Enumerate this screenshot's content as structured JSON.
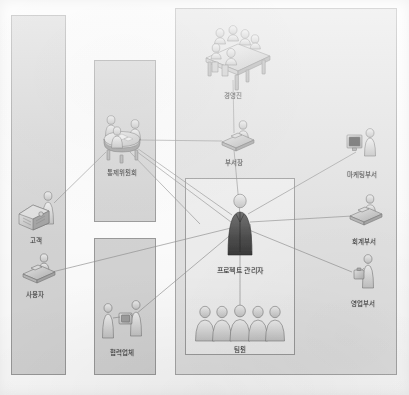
{
  "diagram": {
    "type": "stakeholder-org-diagram",
    "center_node": {
      "id": "project-manager",
      "label": "프로젝트 관리자",
      "x": 240,
      "y": 222
    },
    "groups": [
      {
        "id": "external-group",
        "name": "외부 이해관계자",
        "x": 11,
        "y": 15,
        "w": 55,
        "h": 360,
        "fill": "#d4d4d4",
        "nodes": [
          "customer",
          "user"
        ]
      },
      {
        "id": "control-group",
        "name": "통제위원회 영역",
        "x": 94,
        "y": 60,
        "w": 62,
        "h": 162,
        "fill": "#d4d4d4",
        "nodes": [
          "control-committee"
        ]
      },
      {
        "id": "partner-group",
        "name": "협력업체 영역",
        "x": 94,
        "y": 238,
        "w": 62,
        "h": 137,
        "fill": "#d4d4d4",
        "nodes": [
          "partner-company"
        ]
      },
      {
        "id": "organization-group",
        "name": "수행조직 영역",
        "x": 175,
        "y": 8,
        "w": 222,
        "h": 367,
        "fill": "#e2e2e2",
        "nodes": [
          "executives",
          "department-head",
          "marketing-dept",
          "accounting-dept",
          "sales-dept"
        ]
      },
      {
        "id": "project-team-group",
        "name": "프로젝트 팀 영역",
        "x": 185,
        "y": 178,
        "w": 110,
        "h": 177,
        "fill": "#eeeeee",
        "nodes": [
          "project-manager",
          "team-members"
        ]
      }
    ],
    "nodes": [
      {
        "id": "executives",
        "label": "경영진",
        "icon": "meeting-table-icon",
        "x": 233,
        "y": 63,
        "label_x": 233,
        "label_y": 93
      },
      {
        "id": "department-head",
        "label": "부서장",
        "icon": "person-desk-icon",
        "x": 234,
        "y": 140,
        "label_x": 234,
        "label_y": 160
      },
      {
        "id": "marketing-dept",
        "label": "마케팅부서",
        "icon": "person-monitor-icon",
        "x": 364,
        "y": 147,
        "label_x": 362,
        "label_y": 172
      },
      {
        "id": "accounting-dept",
        "label": "회계부서",
        "icon": "person-desk-icon",
        "x": 364,
        "y": 212,
        "label_x": 364,
        "label_y": 239
      },
      {
        "id": "sales-dept",
        "label": "영업부서",
        "icon": "person-briefcase-icon",
        "x": 363,
        "y": 272,
        "label_x": 363,
        "label_y": 301
      },
      {
        "id": "control-committee",
        "label": "통제위원회",
        "icon": "round-table-icon",
        "x": 120,
        "y": 135,
        "label_x": 122,
        "label_y": 170
      },
      {
        "id": "partner-company",
        "label": "협력업체",
        "icon": "handshake-icon",
        "x": 120,
        "y": 320,
        "label_x": 122,
        "label_y": 350
      },
      {
        "id": "customer",
        "label": "고객",
        "icon": "person-machine-icon",
        "x": 38,
        "y": 208,
        "label_x": 36,
        "label_y": 238
      },
      {
        "id": "user",
        "label": "사용자",
        "icon": "person-desk-icon",
        "x": 38,
        "y": 268,
        "label_x": 35,
        "label_y": 292
      },
      {
        "id": "project-manager",
        "label": "프로젝트 관리자",
        "icon": "person-dark-icon",
        "x": 240,
        "y": 222,
        "label_x": 240,
        "label_y": 268
      },
      {
        "id": "team-members",
        "label": "팀원",
        "icon": "people-row-icon",
        "x": 240,
        "y": 325,
        "label_x": 240,
        "label_y": 347
      }
    ],
    "edges": [
      {
        "from": "project-manager",
        "to": "department-head",
        "style": "solid"
      },
      {
        "from": "project-manager",
        "to": "marketing-dept",
        "style": "solid"
      },
      {
        "from": "project-manager",
        "to": "accounting-dept",
        "style": "solid"
      },
      {
        "from": "project-manager",
        "to": "sales-dept",
        "style": "solid"
      },
      {
        "from": "project-manager",
        "to": "control-committee",
        "style": "solid"
      },
      {
        "from": "project-manager",
        "to": "customer",
        "style": "solid"
      },
      {
        "from": "project-manager",
        "to": "user",
        "style": "solid"
      },
      {
        "from": "project-manager",
        "to": "partner-company",
        "style": "solid"
      },
      {
        "from": "project-manager",
        "to": "team-members",
        "style": "solid"
      },
      {
        "from": "department-head",
        "to": "executives",
        "style": "solid"
      },
      {
        "from": "department-head",
        "to": "control-committee",
        "style": "solid"
      },
      {
        "from": "control-committee",
        "to": "customer",
        "style": "solid"
      }
    ],
    "colors": {
      "panel_fill": "#d4d4d4",
      "panel_big_fill": "#e2e2e2",
      "panel_inner_fill": "#eeeeee",
      "panel_border": "#9a9a9a",
      "line": "#8e8e8e",
      "label_text": "#3d3d3d",
      "figure_light": "#d6d6d6",
      "figure_dark": "#4a4a4a",
      "paper": "#fdfdfd"
    }
  }
}
